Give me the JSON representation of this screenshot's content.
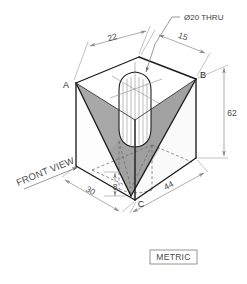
{
  "drawing": {
    "title_note": "Ø20 THRU",
    "view_label": "FRONT VIEW",
    "units_label": "METRIC",
    "vertex_labels": {
      "a": "A",
      "b": "B",
      "c": "C"
    },
    "dimensions": [
      {
        "id": "top-left-depth",
        "value": "22"
      },
      {
        "id": "top-right-offset",
        "value": "15"
      },
      {
        "id": "overall-height",
        "value": "62"
      },
      {
        "id": "base-depth",
        "value": "30"
      },
      {
        "id": "base-width",
        "value": "44"
      },
      {
        "id": "notch-bottom-height",
        "value": "8"
      }
    ],
    "colors": {
      "notch_face_fill": "#a8a8a8",
      "side_face_fill": "#fafafa",
      "top_face_fill": "#ffffff",
      "outline": "#1c1c1c",
      "hidden_line": "#6e6e6e",
      "dimension_line": "#8a8a8a",
      "text": "#4a4a4a",
      "background": "#ffffff"
    }
  }
}
